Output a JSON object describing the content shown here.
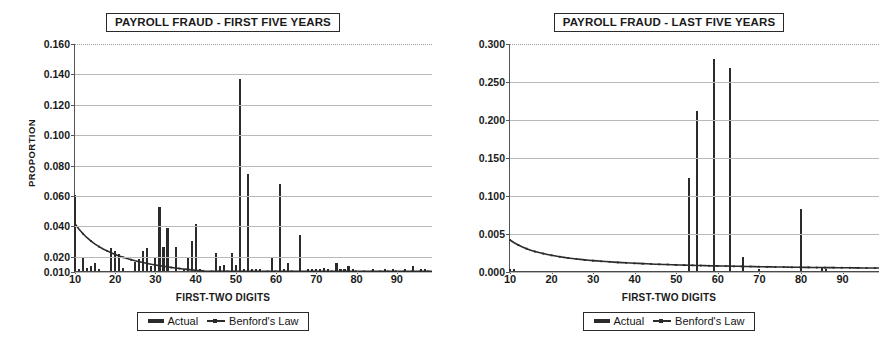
{
  "charts": [
    {
      "title": "PAYROLL FRAUD - FIRST FIVE YEARS",
      "ylabel": "PROPORTION",
      "xlabel": "FIRST-TWO DIGITS",
      "legend": {
        "actual": "Actual",
        "benford": "Benford's Law"
      }
    },
    {
      "title": "PAYROLL FRAUD - LAST FIVE YEARS",
      "ylabel": "",
      "xlabel": "FIRST-TWO DIGITS",
      "legend": {
        "actual": "Actual",
        "benford": "Benford's Law"
      }
    }
  ],
  "chart_data": [
    {
      "type": "bar",
      "title": "PAYROLL FRAUD - FIRST FIVE YEARS",
      "xlabel": "FIRST-TWO DIGITS",
      "ylabel": "PROPORTION",
      "xlim": [
        10,
        99
      ],
      "ylim": [
        0.01,
        0.16
      ],
      "grid": true,
      "legend_position": "below",
      "yticks": [
        "0.010",
        "0.020",
        "0.040",
        "0.060",
        "0.080",
        "0.100",
        "0.120",
        "0.140",
        "0.160"
      ],
      "ytick_values": [
        0.01,
        0.02,
        0.04,
        0.06,
        0.08,
        0.1,
        0.12,
        0.14,
        0.16
      ],
      "xticks": [
        "10",
        "20",
        "30",
        "40",
        "50",
        "60",
        "70",
        "80",
        "90"
      ],
      "xtick_values": [
        10,
        20,
        30,
        40,
        50,
        60,
        70,
        80,
        90
      ],
      "series": [
        {
          "name": "Actual",
          "x": [
            10,
            11,
            12,
            13,
            14,
            15,
            16,
            17,
            18,
            19,
            20,
            21,
            22,
            23,
            24,
            25,
            26,
            27,
            28,
            29,
            30,
            31,
            32,
            33,
            34,
            35,
            36,
            37,
            38,
            39,
            40,
            41,
            42,
            43,
            44,
            45,
            46,
            47,
            48,
            49,
            50,
            51,
            52,
            53,
            54,
            55,
            56,
            57,
            58,
            59,
            60,
            61,
            62,
            63,
            64,
            65,
            66,
            67,
            68,
            69,
            70,
            71,
            72,
            73,
            74,
            75,
            76,
            77,
            78,
            79,
            80,
            81,
            82,
            83,
            84,
            85,
            86,
            87,
            88,
            89,
            90,
            91,
            92,
            93,
            94,
            95,
            96,
            97,
            98,
            99
          ],
          "values": [
            0.06,
            0.011,
            0.019,
            0.012,
            0.013,
            0.015,
            0.011,
            0.01,
            0.01,
            0.025,
            0.023,
            0.021,
            0.012,
            0.01,
            0.01,
            0.016,
            0.018,
            0.023,
            0.025,
            0.013,
            0.019,
            0.052,
            0.026,
            0.038,
            0.01,
            0.026,
            0.01,
            0.011,
            0.019,
            0.03,
            0.041,
            0.011,
            0.01,
            0.01,
            0.01,
            0.022,
            0.013,
            0.014,
            0.01,
            0.022,
            0.014,
            0.136,
            0.011,
            0.074,
            0.011,
            0.011,
            0.011,
            0.01,
            0.01,
            0.019,
            0.01,
            0.067,
            0.011,
            0.015,
            0.01,
            0.01,
            0.034,
            0.01,
            0.011,
            0.011,
            0.011,
            0.011,
            0.012,
            0.011,
            0.01,
            0.015,
            0.011,
            0.011,
            0.013,
            0.011,
            0.01,
            0.01,
            0.01,
            0.01,
            0.011,
            0.01,
            0.01,
            0.011,
            0.01,
            0.011,
            0.01,
            0.01,
            0.011,
            0.01,
            0.013,
            0.01,
            0.011,
            0.011,
            0.01,
            0.01
          ]
        },
        {
          "name": "Benford's Law",
          "x": [
            10,
            11,
            12,
            13,
            14,
            15,
            16,
            17,
            18,
            19,
            20,
            21,
            22,
            23,
            24,
            25,
            26,
            27,
            28,
            29,
            30,
            31,
            32,
            33,
            34,
            35,
            36,
            37,
            38,
            39,
            40,
            41,
            42,
            43,
            44,
            45,
            46,
            47,
            48,
            49,
            50,
            51,
            52,
            53,
            54,
            55,
            56,
            57,
            58,
            59,
            60,
            61,
            62,
            63,
            64,
            65,
            66,
            67,
            68,
            69,
            70,
            71,
            72,
            73,
            74,
            75,
            76,
            77,
            78,
            79,
            80,
            81,
            82,
            83,
            84,
            85,
            86,
            87,
            88,
            89,
            90,
            91,
            92,
            93,
            94,
            95,
            96,
            97,
            98,
            99
          ],
          "values": [
            0.0414,
            0.0378,
            0.0348,
            0.0322,
            0.03,
            0.028,
            0.0263,
            0.0248,
            0.0235,
            0.0223,
            0.0212,
            0.0202,
            0.0193,
            0.0185,
            0.0177,
            0.017,
            0.0164,
            0.0158,
            0.0152,
            0.0147,
            0.0142,
            0.0138,
            0.0134,
            0.013,
            0.0126,
            0.0122,
            0.0119,
            0.0116,
            0.0113,
            0.011,
            0.0107,
            0.0105,
            0.0102,
            0.01,
            0.0098,
            0.0095,
            0.0093,
            0.0091,
            0.009,
            0.0088,
            0.0086,
            0.0084,
            0.0083,
            0.0081,
            0.008,
            0.0078,
            0.0077,
            0.0076,
            0.0074,
            0.0073,
            0.0072,
            0.0071,
            0.007,
            0.0069,
            0.0068,
            0.0067,
            0.0066,
            0.0065,
            0.0064,
            0.0063,
            0.0062,
            0.0061,
            0.006,
            0.0059,
            0.0058,
            0.0058,
            0.0057,
            0.0056,
            0.0055,
            0.0055,
            0.0054,
            0.0053,
            0.0053,
            0.0052,
            0.0051,
            0.0051,
            0.005,
            0.005,
            0.0049,
            0.0048,
            0.0048,
            0.0047,
            0.0047,
            0.0046,
            0.0046,
            0.0045,
            0.0045,
            0.0045,
            0.0044,
            0.0044
          ]
        }
      ]
    },
    {
      "type": "bar",
      "title": "PAYROLL FRAUD - LAST FIVE YEARS",
      "xlabel": "FIRST-TWO DIGITS",
      "ylabel": "",
      "xlim": [
        10,
        99
      ],
      "ylim": [
        0.0,
        0.3
      ],
      "grid": true,
      "legend_position": "below",
      "yticks": [
        "0.000",
        "0.005",
        "0.100",
        "0.150",
        "0.200",
        "0.250",
        "0.300"
      ],
      "ytick_values": [
        0.0,
        0.05,
        0.1,
        0.15,
        0.2,
        0.25,
        0.3
      ],
      "xticks": [
        "10",
        "20",
        "30",
        "40",
        "50",
        "60",
        "70",
        "80",
        "90"
      ],
      "xtick_values": [
        10,
        20,
        30,
        40,
        50,
        60,
        70,
        80,
        90
      ],
      "series": [
        {
          "name": "Actual",
          "x": [
            10,
            11,
            12,
            13,
            14,
            15,
            16,
            17,
            18,
            19,
            20,
            21,
            22,
            23,
            24,
            25,
            26,
            27,
            28,
            29,
            30,
            31,
            32,
            33,
            34,
            35,
            36,
            37,
            38,
            39,
            40,
            41,
            42,
            43,
            44,
            45,
            46,
            47,
            48,
            49,
            50,
            51,
            52,
            53,
            54,
            55,
            56,
            57,
            58,
            59,
            60,
            61,
            62,
            63,
            64,
            65,
            66,
            67,
            68,
            69,
            70,
            71,
            72,
            73,
            74,
            75,
            76,
            77,
            78,
            79,
            80,
            81,
            82,
            83,
            84,
            85,
            86,
            87,
            88,
            89,
            90,
            91,
            92,
            93,
            94,
            95,
            96,
            97,
            98,
            99
          ],
          "values": [
            0.003,
            0.002,
            0.0,
            0.0,
            0.0,
            0.0,
            0.0,
            0.0,
            0.0,
            0.0,
            0.0,
            0.0,
            0.0,
            0.0,
            0.0,
            0.0,
            0.0,
            0.0,
            0.0,
            0.0,
            0.0,
            0.0,
            0.0,
            0.0,
            0.0,
            0.0,
            0.0,
            0.0,
            0.0,
            0.0,
            0.0,
            0.0,
            0.0,
            0.0,
            0.0,
            0.0,
            0.0,
            0.0,
            0.0,
            0.0,
            0.0,
            0.0,
            0.0,
            0.122,
            0.0,
            0.21,
            0.0,
            0.0,
            0.0,
            0.279,
            0.0,
            0.0,
            0.0,
            0.267,
            0.0,
            0.0,
            0.018,
            0.0,
            0.0,
            0.0,
            0.003,
            0.0,
            0.0,
            0.0,
            0.0,
            0.0,
            0.0,
            0.0,
            0.0,
            0.0,
            0.082,
            0.0,
            0.0,
            0.0,
            0.0,
            0.004,
            0.003,
            0.0,
            0.0,
            0.0,
            0.0,
            0.0,
            0.0,
            0.0,
            0.0,
            0.0,
            0.0,
            0.0,
            0.0,
            0.0
          ]
        },
        {
          "name": "Benford's Law",
          "x": [
            10,
            11,
            12,
            13,
            14,
            15,
            16,
            17,
            18,
            19,
            20,
            21,
            22,
            23,
            24,
            25,
            26,
            27,
            28,
            29,
            30,
            31,
            32,
            33,
            34,
            35,
            36,
            37,
            38,
            39,
            40,
            41,
            42,
            43,
            44,
            45,
            46,
            47,
            48,
            49,
            50,
            51,
            52,
            53,
            54,
            55,
            56,
            57,
            58,
            59,
            60,
            61,
            62,
            63,
            64,
            65,
            66,
            67,
            68,
            69,
            70,
            71,
            72,
            73,
            74,
            75,
            76,
            77,
            78,
            79,
            80,
            81,
            82,
            83,
            84,
            85,
            86,
            87,
            88,
            89,
            90,
            91,
            92,
            93,
            94,
            95,
            96,
            97,
            98,
            99
          ],
          "values": [
            0.0414,
            0.0378,
            0.0348,
            0.0322,
            0.03,
            0.028,
            0.0263,
            0.0248,
            0.0235,
            0.0223,
            0.0212,
            0.0202,
            0.0193,
            0.0185,
            0.0177,
            0.017,
            0.0164,
            0.0158,
            0.0152,
            0.0147,
            0.0142,
            0.0138,
            0.0134,
            0.013,
            0.0126,
            0.0122,
            0.0119,
            0.0116,
            0.0113,
            0.011,
            0.0107,
            0.0105,
            0.0102,
            0.01,
            0.0098,
            0.0095,
            0.0093,
            0.0091,
            0.009,
            0.0088,
            0.0086,
            0.0084,
            0.0083,
            0.0081,
            0.008,
            0.0078,
            0.0077,
            0.0076,
            0.0074,
            0.0073,
            0.0072,
            0.0071,
            0.007,
            0.0069,
            0.0068,
            0.0067,
            0.0066,
            0.0065,
            0.0064,
            0.0063,
            0.0062,
            0.0061,
            0.006,
            0.0059,
            0.0058,
            0.0058,
            0.0057,
            0.0056,
            0.0055,
            0.0055,
            0.0054,
            0.0053,
            0.0053,
            0.0052,
            0.0051,
            0.0051,
            0.005,
            0.005,
            0.0049,
            0.0048,
            0.0048,
            0.0047,
            0.0047,
            0.0046,
            0.0046,
            0.0045,
            0.0045,
            0.0045,
            0.0044,
            0.0044
          ]
        }
      ]
    }
  ],
  "colors": {
    "bar": "#2b2b2b",
    "benford_line": "#2b2b2b",
    "grid": "#b9b9b9",
    "axis": "#555555",
    "background": "#ffffff"
  }
}
